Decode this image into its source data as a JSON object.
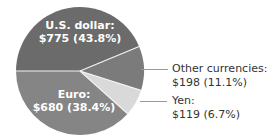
{
  "chart_data": {
    "type": "pie",
    "title": "",
    "unit": "$",
    "slices": [
      {
        "name": "U.S. dollar",
        "value": 775,
        "percent": 43.8,
        "label": "U.S. dollar:",
        "value_label": "$775 (43.8%)",
        "color": "#6b6b6b",
        "label_position": "inside"
      },
      {
        "name": "Other currencies",
        "value": 198,
        "percent": 11.1,
        "label": "Other currencies:",
        "value_label": "$198 (11.1%)",
        "color": "#7b7b7b",
        "label_position": "outside"
      },
      {
        "name": "Yen",
        "value": 119,
        "percent": 6.7,
        "label": "Yen:",
        "value_label": "$119 (6.7%)",
        "color": "#d9d9d9",
        "label_position": "outside"
      },
      {
        "name": "Euro",
        "value": 680,
        "percent": 38.4,
        "label": "Euro:",
        "value_label": "$680 (38.4%)",
        "color": "#858585",
        "label_position": "inside"
      }
    ],
    "start_angle_deg": 180,
    "direction": "clockwise",
    "legend": "none"
  },
  "colors": {
    "divider": "#f2f2f2",
    "leader_line": "#999999",
    "outside_text": "#333333",
    "inside_text": "#ffffff"
  }
}
